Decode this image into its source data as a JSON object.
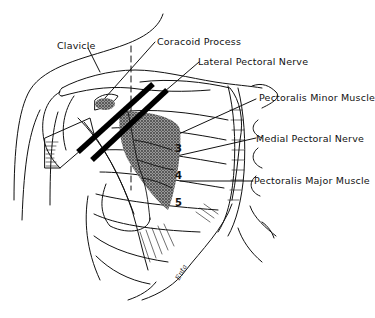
{
  "figure": {
    "line_color": "#111111",
    "shade_color": "#6e6e6e",
    "background": "#ffffff"
  },
  "labels": {
    "clavicle": "Clavicle",
    "coracoid_process": "Coracoid Process",
    "lateral_pectoral_nerve": "Lateral Pectoral Nerve",
    "pectoralis_minor_muscle": "Pectoralis Minor Muscle",
    "medial_pectoral_nerve": "Medial Pectoral Nerve",
    "pectoralis_major_muscle": "Pectoralis Major Muscle"
  },
  "rib_numbers": [
    "3",
    "4",
    "5"
  ],
  "signature": "Enta"
}
